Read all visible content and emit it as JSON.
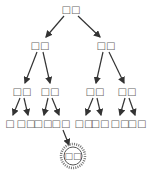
{
  "tree": {
    "root": {
      "label": "□□",
      "x": 71,
      "y": 10
    },
    "level2": [
      {
        "label": "□□",
        "x": 40,
        "y": 46
      },
      {
        "label": "□□",
        "x": 106,
        "y": 46
      }
    ],
    "level3": [
      {
        "label": "□□",
        "x": 22,
        "y": 92
      },
      {
        "label": "□□",
        "x": 50,
        "y": 92
      },
      {
        "label": "□□",
        "x": 95,
        "y": 92
      },
      {
        "label": "□□",
        "x": 127,
        "y": 92
      }
    ],
    "leaves": [
      {
        "label": "□",
        "x": 10,
        "y": 124
      },
      {
        "label": "□□",
        "x": 26,
        "y": 124
      },
      {
        "label": "□□",
        "x": 43,
        "y": 124
      },
      {
        "label": "□□",
        "x": 61,
        "y": 124
      },
      {
        "label": "□□",
        "x": 84,
        "y": 124
      },
      {
        "label": "□□",
        "x": 100,
        "y": 124
      },
      {
        "label": "□□",
        "x": 120,
        "y": 124
      },
      {
        "label": "□□",
        "x": 137,
        "y": 124
      }
    ],
    "highlighted": {
      "label": "□□",
      "x": 73,
      "y": 156
    },
    "colors": {
      "arrow": "#333333",
      "text": "#666666",
      "highlight_ring": "#555555"
    }
  }
}
